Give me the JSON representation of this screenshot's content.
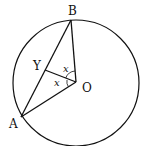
{
  "diagram": {
    "type": "circle-geometry",
    "stroke_color": "#111111",
    "background": "#ffffff",
    "circle": {
      "cx": 76,
      "cy": 83,
      "r": 63
    },
    "points": {
      "B": {
        "label": "B",
        "x": 71,
        "y": 20,
        "label_x": 68,
        "label_y": 15
      },
      "A": {
        "label": "A",
        "x": 21,
        "y": 117,
        "label_x": 9,
        "label_y": 128
      },
      "O": {
        "label": "O",
        "x": 76,
        "y": 82,
        "label_x": 82,
        "label_y": 92
      },
      "Y": {
        "label": "Y",
        "x": 45,
        "y": 70,
        "label_x": 33,
        "label_y": 70
      }
    },
    "segments": [
      "AB",
      "BO",
      "AO",
      "YO"
    ],
    "angle_labels": [
      {
        "text": "x",
        "between": "YO-BO",
        "x": 63,
        "y": 72
      },
      {
        "text": "x",
        "between": "YO-AO",
        "x": 54,
        "y": 86
      }
    ]
  }
}
